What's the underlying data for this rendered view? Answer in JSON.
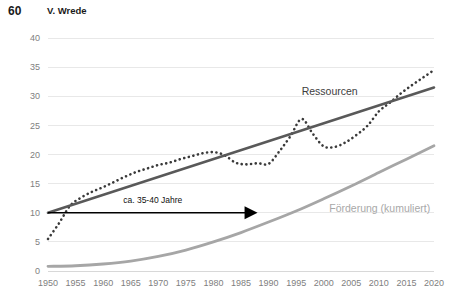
{
  "header": {
    "page_number": "60",
    "running_head": "V. Wrede"
  },
  "chart_data": {
    "type": "line",
    "title": "",
    "xlabel": "",
    "ylabel": "",
    "xlim": [
      1950,
      2020
    ],
    "ylim": [
      0,
      40
    ],
    "grid": true,
    "legend_position": "inline-labels",
    "x_ticks": [
      "1950",
      "1955",
      "1960",
      "1965",
      "1970",
      "1975",
      "1980",
      "1985",
      "1990",
      "1995",
      "2000",
      "2005",
      "2010",
      "2015",
      "2020"
    ],
    "y_ticks": [
      "0",
      "5",
      "10",
      "15",
      "20",
      "25",
      "30",
      "35",
      "40"
    ],
    "series": [
      {
        "name": "Ressourcen",
        "style": "dotted",
        "color": "#3a3a3a",
        "label": "Ressourcen",
        "label_x": 1996,
        "label_y": 30.2,
        "x": [
          1950,
          1952,
          1954,
          1956,
          1958,
          1960,
          1962,
          1964,
          1966,
          1968,
          1970,
          1972,
          1974,
          1976,
          1978,
          1980,
          1982,
          1984,
          1986,
          1988,
          1990,
          1992,
          1994,
          1996,
          1998,
          2000,
          2002,
          2004,
          2006,
          2008,
          2010,
          2012,
          2014,
          2016,
          2018,
          2020
        ],
        "y": [
          5.5,
          8.2,
          11.2,
          12.6,
          13.6,
          14.4,
          15.3,
          16.2,
          17.0,
          17.6,
          18.2,
          18.6,
          19.2,
          19.7,
          20.2,
          20.4,
          19.9,
          18.6,
          18.3,
          18.5,
          18.4,
          20.6,
          23.2,
          26.1,
          23.6,
          21.4,
          21.3,
          22.1,
          23.4,
          25.0,
          27.4,
          28.9,
          30.5,
          31.9,
          33.2,
          34.5
        ]
      },
      {
        "name": "Ressourcen-Trendlinie",
        "style": "solid",
        "color": "#595959",
        "x": [
          1950,
          2020
        ],
        "y": [
          10.0,
          31.5
        ]
      },
      {
        "name": "Förderung (kumuliert)",
        "style": "solid",
        "color": "#a6a6a6",
        "label": "Förderung (kumuliert)",
        "label_x": 2001,
        "label_y": 10.1,
        "x": [
          1950,
          1955,
          1960,
          1965,
          1970,
          1975,
          1980,
          1985,
          1990,
          1995,
          2000,
          2005,
          2010,
          2015,
          2020
        ],
        "y": [
          0.8,
          0.9,
          1.2,
          1.7,
          2.5,
          3.6,
          5.0,
          6.6,
          8.4,
          10.3,
          12.4,
          14.6,
          16.9,
          19.2,
          21.5
        ]
      }
    ],
    "annotations": [
      {
        "text": "ca. 35-40 Jahre",
        "type": "arrow",
        "x_start": 1950,
        "x_end": 1988,
        "y": 10.0,
        "text_x": 1969,
        "text_y": 11.6
      }
    ]
  }
}
